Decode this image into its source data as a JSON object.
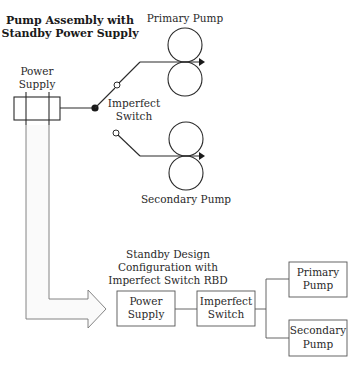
{
  "diagram": {
    "title_lines": [
      "Pump Assembly with",
      "Standby Power Supply"
    ],
    "schematic": {
      "power_supply_label": [
        "Power",
        "Supply"
      ],
      "switch_label": [
        "Imperfect",
        "Switch"
      ],
      "primary_pump_label": "Primary Pump",
      "secondary_pump_label": "Secondary Pump"
    },
    "rbd": {
      "title_lines": [
        "Standby Design",
        "Configuration with",
        "Imperfect Switch RBD"
      ],
      "blocks": [
        {
          "id": "power-supply",
          "lines": [
            "Power",
            "Supply"
          ]
        },
        {
          "id": "imperfect-switch",
          "lines": [
            "Imperfect",
            "Switch"
          ]
        },
        {
          "id": "primary-pump",
          "lines": [
            "Primary",
            "Pump"
          ]
        },
        {
          "id": "secondary-pump",
          "lines": [
            "Secondary",
            "Pump"
          ]
        }
      ]
    },
    "colors": {
      "line": "#2a2a2a",
      "background": "#ffffff"
    }
  }
}
